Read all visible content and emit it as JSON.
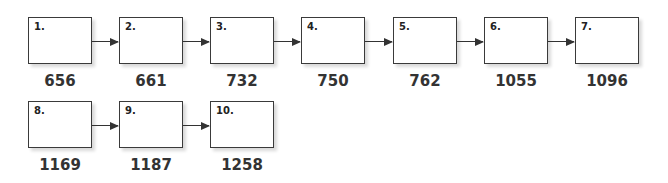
{
  "diagram": {
    "nodes": [
      {
        "label": "1.",
        "value": "656"
      },
      {
        "label": "2.",
        "value": "661"
      },
      {
        "label": "3.",
        "value": "732"
      },
      {
        "label": "4.",
        "value": "750"
      },
      {
        "label": "5.",
        "value": "762"
      },
      {
        "label": "6.",
        "value": "1055"
      },
      {
        "label": "7.",
        "value": "1096"
      },
      {
        "label": "8.",
        "value": "1169"
      },
      {
        "label": "9.",
        "value": "1187"
      },
      {
        "label": "10.",
        "value": "1258"
      }
    ],
    "edges": [
      [
        1,
        2
      ],
      [
        2,
        3
      ],
      [
        3,
        4
      ],
      [
        4,
        5
      ],
      [
        5,
        6
      ],
      [
        6,
        7
      ],
      [
        8,
        9
      ],
      [
        9,
        10
      ]
    ]
  }
}
